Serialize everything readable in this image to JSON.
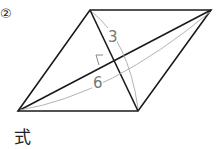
{
  "problem": {
    "number": "②",
    "formula_label": "式"
  },
  "figure": {
    "shape": "rhombus",
    "diagonal_short_label": "3",
    "diagonal_long_label": "6",
    "line_color": "#1a1a1a",
    "measure_color": "#999999"
  }
}
